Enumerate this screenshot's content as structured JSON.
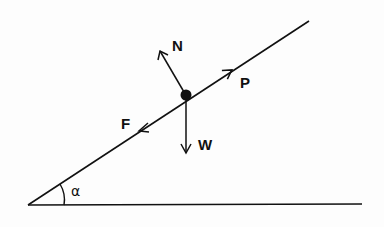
{
  "diagram": {
    "title": "",
    "type": "force-diagram-inclined-plane",
    "labels": {
      "normal": "N",
      "push": "P",
      "friction": "F",
      "weight": "W",
      "angle": "α"
    },
    "colors": {
      "ink": "#111111",
      "background": "#fdfdfd"
    }
  }
}
